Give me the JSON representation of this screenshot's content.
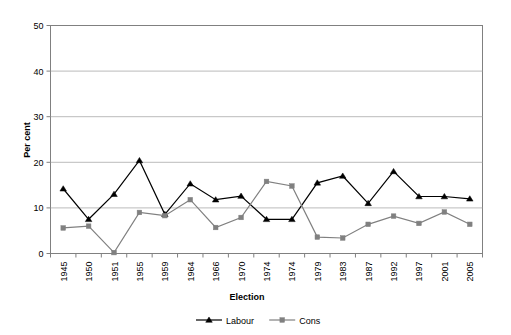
{
  "chart_data": {
    "type": "line",
    "title": "",
    "xlabel": "Election",
    "ylabel": "Per cent",
    "ylim": [
      0,
      50
    ],
    "yticks": [
      0,
      10,
      20,
      30,
      40,
      50
    ],
    "grid": true,
    "legend_position": "bottom",
    "categories": [
      "1945",
      "1950",
      "1951",
      "1955",
      "1959",
      "1964",
      "1966",
      "1970",
      "1974",
      "1974",
      "1979",
      "1983",
      "1987",
      "1992",
      "1997",
      "2001",
      "2005"
    ],
    "series": [
      {
        "name": "Labour",
        "marker": "triangle",
        "color": "#000000",
        "values": [
          14.2,
          7.5,
          13.0,
          20.4,
          8.6,
          15.3,
          11.8,
          12.6,
          7.5,
          7.5,
          15.5,
          17.0,
          11.0,
          18.0,
          12.5,
          12.5,
          12.0
        ]
      },
      {
        "name": "Cons",
        "marker": "square",
        "color": "#808080",
        "values": [
          5.6,
          6.0,
          0.2,
          9.0,
          8.3,
          11.8,
          5.7,
          7.9,
          15.8,
          14.8,
          3.6,
          3.4,
          6.4,
          8.2,
          6.6,
          9.1,
          6.4
        ]
      }
    ]
  },
  "axes": {
    "y_title": "Per cent",
    "x_title": "Election",
    "y_tick_labels": [
      "0",
      "10",
      "20",
      "30",
      "40",
      "50"
    ],
    "x_tick_labels": [
      "1945",
      "1950",
      "1951",
      "1955",
      "1959",
      "1964",
      "1966",
      "1970",
      "1974",
      "1974",
      "1979",
      "1983",
      "1987",
      "1992",
      "1997",
      "2001",
      "2005"
    ]
  },
  "legend": {
    "items": [
      {
        "label": "Labour",
        "color": "#000000",
        "marker": "triangle"
      },
      {
        "label": "Cons",
        "color": "#808080",
        "marker": "square"
      }
    ]
  }
}
